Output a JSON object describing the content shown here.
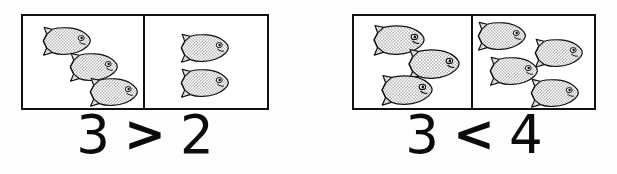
{
  "page": {
    "background_color": "#fdfdfd",
    "ink_color": "#111111",
    "fish_fill_color": "#d8d8d8",
    "fish_outline_color": "#111111"
  },
  "comparisons": [
    {
      "id": "comparison-1",
      "left_count": 3,
      "right_count": 2,
      "left_label": "3",
      "operator": ">",
      "right_label": "2",
      "operator_name": "greater-than",
      "left_fish": [
        {
          "x": 9,
          "y": 10,
          "scale": 1.0
        },
        {
          "x": 36,
          "y": 36,
          "scale": 1.0
        },
        {
          "x": 56,
          "y": 61,
          "scale": 1.0
        }
      ],
      "right_fish": [
        {
          "x": 25,
          "y": 17,
          "scale": 1.0
        },
        {
          "x": 25,
          "y": 52,
          "scale": 1.0
        }
      ]
    },
    {
      "id": "comparison-2",
      "left_count": 3,
      "right_count": 4,
      "left_label": "3",
      "operator": "<",
      "right_label": "4",
      "operator_name": "less-than",
      "left_fish": [
        {
          "x": 8,
          "y": 8,
          "scale": 1.06
        },
        {
          "x": 43,
          "y": 32,
          "scale": 1.06
        },
        {
          "x": 16,
          "y": 58,
          "scale": 1.06
        }
      ],
      "right_fish": [
        {
          "x": -6,
          "y": 5,
          "scale": 1.0
        },
        {
          "x": 51,
          "y": 22,
          "scale": 1.0
        },
        {
          "x": 6,
          "y": 40,
          "scale": 1.0
        },
        {
          "x": 47,
          "y": 62,
          "scale": 1.0
        }
      ]
    }
  ]
}
